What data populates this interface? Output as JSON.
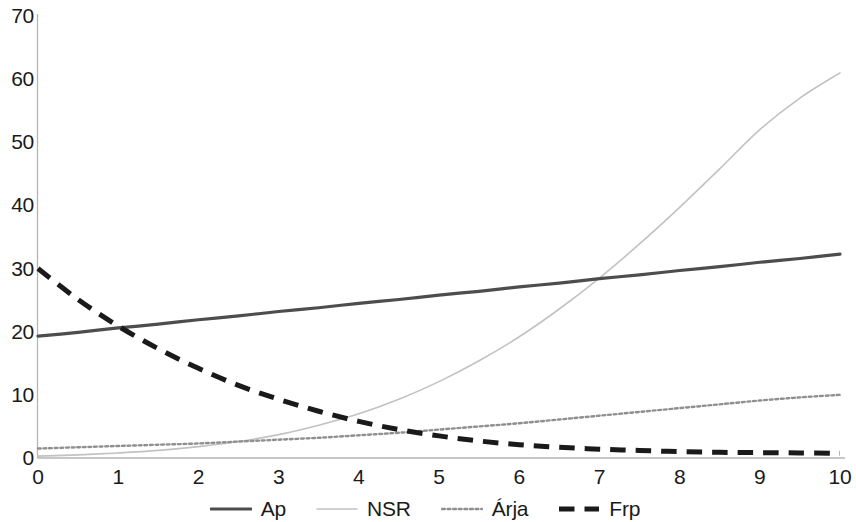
{
  "chart_data": {
    "type": "line",
    "title": "",
    "subtitle": "",
    "xlabel": "",
    "ylabel": "",
    "xlim": [
      0,
      10
    ],
    "ylim": [
      0,
      70
    ],
    "grid": false,
    "legend_position": "bottom",
    "x_ticks": [
      "0",
      "1",
      "2",
      "3",
      "4",
      "5",
      "6",
      "7",
      "8",
      "9",
      "10"
    ],
    "y_ticks": [
      "0",
      "10",
      "20",
      "30",
      "40",
      "50",
      "60",
      "70"
    ],
    "x": [
      0,
      0.5,
      1,
      1.5,
      2,
      2.5,
      3,
      3.5,
      4,
      4.5,
      5,
      5.5,
      6,
      6.5,
      7,
      7.5,
      8,
      8.5,
      9,
      9.5,
      10
    ],
    "series": [
      {
        "name": "Ap",
        "style": "solid",
        "color": "#4d4d4d",
        "width": 3.2,
        "values": [
          19.3,
          19.9,
          20.6,
          21.2,
          21.9,
          22.5,
          23.2,
          23.8,
          24.5,
          25.1,
          25.8,
          26.4,
          27.1,
          27.7,
          28.4,
          29.0,
          29.7,
          30.3,
          31.0,
          31.6,
          32.3
        ]
      },
      {
        "name": "NSR",
        "style": "solid",
        "color": "#c2c2c2",
        "width": 1.6,
        "values": [
          0.3,
          0.5,
          0.8,
          1.2,
          1.8,
          2.6,
          3.7,
          5.2,
          7.0,
          9.3,
          12.1,
          15.4,
          19.2,
          23.6,
          28.5,
          33.9,
          39.7,
          45.8,
          52.0,
          57.0,
          61.0
        ]
      },
      {
        "name": "Árja",
        "style": "dotted",
        "color": "#8f8f8f",
        "width": 2.4,
        "values": [
          1.5,
          1.7,
          1.9,
          2.1,
          2.3,
          2.6,
          2.9,
          3.2,
          3.6,
          4.0,
          4.5,
          5.0,
          5.5,
          6.1,
          6.7,
          7.3,
          7.9,
          8.5,
          9.1,
          9.6,
          10.0
        ]
      },
      {
        "name": "Frp",
        "style": "dashed",
        "color": "#1a1a1a",
        "width": 5.0,
        "values": [
          30.0,
          25.1,
          20.9,
          17.3,
          14.2,
          11.5,
          9.3,
          7.4,
          5.8,
          4.5,
          3.5,
          2.7,
          2.1,
          1.7,
          1.4,
          1.2,
          1.0,
          0.9,
          0.85,
          0.8,
          0.75
        ]
      }
    ]
  },
  "axes": {
    "axis_color": "#b5b5b5"
  }
}
